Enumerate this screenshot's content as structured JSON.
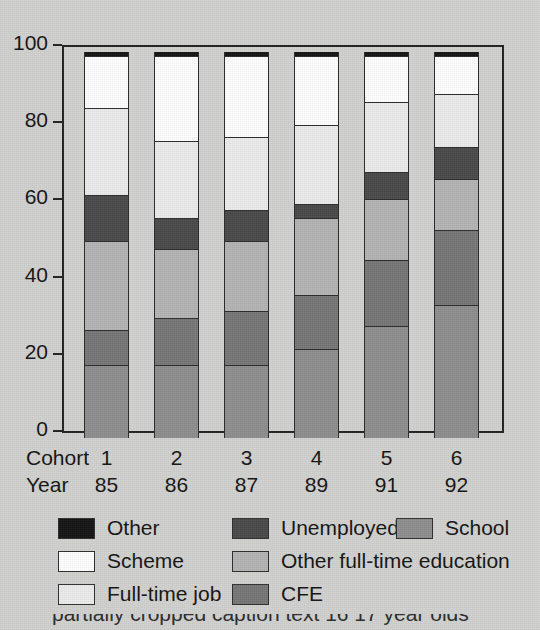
{
  "chart_data": {
    "type": "bar",
    "subtype": "stacked-bar-100-percent",
    "title": "",
    "xlabel": "",
    "ylabel": "",
    "ylim": [
      0,
      100
    ],
    "yticks": [
      0,
      20,
      40,
      60,
      80,
      100
    ],
    "ytick_labels": [
      "0",
      "20",
      "40",
      "60",
      "80",
      "100"
    ],
    "grid": false,
    "legend_position": "below-axes",
    "categories": [
      "1",
      "2",
      "3",
      "4",
      "5",
      "6"
    ],
    "row_labels": [
      "Cohort",
      "Year"
    ],
    "cohort_labels": [
      "1",
      "2",
      "3",
      "4",
      "5",
      "6"
    ],
    "year_labels": [
      "85",
      "86",
      "87",
      "89",
      "91",
      "92"
    ],
    "stack_order_bottom_to_top": [
      "School",
      "CFE",
      "Other full-time education",
      "Unemployed",
      "Full-time job",
      "Scheme",
      "Other"
    ],
    "series": [
      {
        "name": "School",
        "color": "#8e8e8e",
        "values": [
          19,
          19,
          19,
          23,
          29,
          34.5
        ]
      },
      {
        "name": "CFE",
        "color": "#777777",
        "values": [
          9,
          12,
          14,
          14,
          17,
          19.5
        ]
      },
      {
        "name": "Other full-time education",
        "color": "#b4b4b4",
        "values": [
          23,
          18,
          18,
          20,
          16,
          13
        ]
      },
      {
        "name": "Unemployed",
        "color": "#4a4a4a",
        "values": [
          12,
          8,
          8,
          3.5,
          7,
          8.5
        ]
      },
      {
        "name": "Full-time job",
        "color": "#ececec",
        "values": [
          22.5,
          20,
          19,
          20.5,
          18,
          13.5
        ]
      },
      {
        "name": "Scheme",
        "color": "#ffffff",
        "values": [
          13.5,
          22,
          21,
          18,
          12,
          10
        ]
      },
      {
        "name": "Other",
        "color": "#151515",
        "values": [
          1,
          1,
          1,
          1,
          1,
          1
        ]
      }
    ]
  },
  "legend": {
    "items": [
      {
        "label": "Other",
        "color": "#151515"
      },
      {
        "label": "Unemployed",
        "color": "#4a4a4a"
      },
      {
        "label": "School",
        "color": "#8e8e8e"
      },
      {
        "label": "Scheme",
        "color": "#ffffff"
      },
      {
        "label": "Other full-time education",
        "color": "#b4b4b4"
      },
      {
        "label": "Full-time job",
        "color": "#ececec"
      },
      {
        "label": "CFE",
        "color": "#777777"
      }
    ]
  },
  "caption_sliver": "partially cropped caption text 16  17 year olds"
}
